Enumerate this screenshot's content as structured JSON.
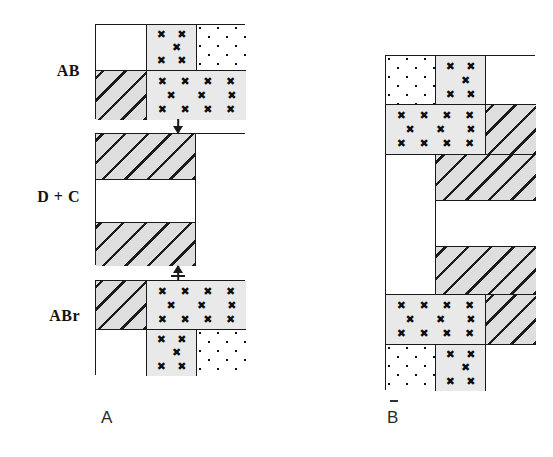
{
  "figure": {
    "row_labels": [
      {
        "id": "ab",
        "text": "AB"
      },
      {
        "id": "dc",
        "text": "D + C"
      },
      {
        "id": "abr",
        "text": "ABr"
      }
    ],
    "panel_captions": [
      {
        "id": "a",
        "text": "A"
      },
      {
        "id": "b",
        "text": "B"
      }
    ],
    "legend_fills": {
      "white": "unfilled plot",
      "hatch": "diagonal-hatched plot",
      "xmark": "x-marked plot",
      "dots": "dotted plot"
    },
    "colors": {
      "ink": "#1a1a1a",
      "hatch_fill": "#dedede",
      "xmark_fill": "#e9e9e9",
      "paper": "#ffffff"
    },
    "x_glyph": "✖",
    "panel_a": {
      "name": "A",
      "blocks": [
        {
          "id": "ab",
          "label": "AB",
          "cells": [
            {
              "id": "ab-r1c1",
              "fill": "white"
            },
            {
              "id": "ab-r1c2",
              "fill": "xmark"
            },
            {
              "id": "ab-r1c3",
              "fill": "dots"
            },
            {
              "id": "ab-r2c1",
              "fill": "hatch"
            },
            {
              "id": "ab-r2c2",
              "fill": "xmark"
            }
          ]
        },
        {
          "id": "dc",
          "label": "D + C",
          "cells": [
            {
              "id": "dc-r1",
              "fill": "hatch"
            },
            {
              "id": "dc-r2",
              "fill": "white"
            },
            {
              "id": "dc-r3",
              "fill": "hatch"
            },
            {
              "id": "dc-right",
              "fill": "white"
            }
          ]
        },
        {
          "id": "abr",
          "label": "ABr",
          "cells": [
            {
              "id": "abr-r1c1",
              "fill": "hatch"
            },
            {
              "id": "abr-r1c2",
              "fill": "xmark"
            },
            {
              "id": "abr-r2c1",
              "fill": "white"
            },
            {
              "id": "abr-r2c2",
              "fill": "xmark"
            },
            {
              "id": "abr-r2c3",
              "fill": "dots"
            }
          ]
        }
      ],
      "connectors": [
        {
          "id": "ab-to-dc",
          "direction": "down"
        },
        {
          "id": "dc-to-abr",
          "direction": "up"
        }
      ]
    },
    "panel_b": {
      "name": "B",
      "cells": [
        {
          "id": "b-r1c1",
          "fill": "dots"
        },
        {
          "id": "b-r1c2",
          "fill": "xmark"
        },
        {
          "id": "b-r1c3",
          "fill": "white"
        },
        {
          "id": "b-r2c1",
          "fill": "xmark"
        },
        {
          "id": "b-r2c2",
          "fill": "hatch"
        },
        {
          "id": "b-r3left",
          "fill": "white"
        },
        {
          "id": "b-r3c2",
          "fill": "hatch"
        },
        {
          "id": "b-r4c2",
          "fill": "white"
        },
        {
          "id": "b-r5c2",
          "fill": "hatch"
        },
        {
          "id": "b-r6c1",
          "fill": "xmark"
        },
        {
          "id": "b-r6c2",
          "fill": "hatch"
        },
        {
          "id": "b-r7c1",
          "fill": "dots"
        },
        {
          "id": "b-r7c2",
          "fill": "xmark"
        },
        {
          "id": "b-r7c3",
          "fill": "white"
        }
      ]
    }
  }
}
